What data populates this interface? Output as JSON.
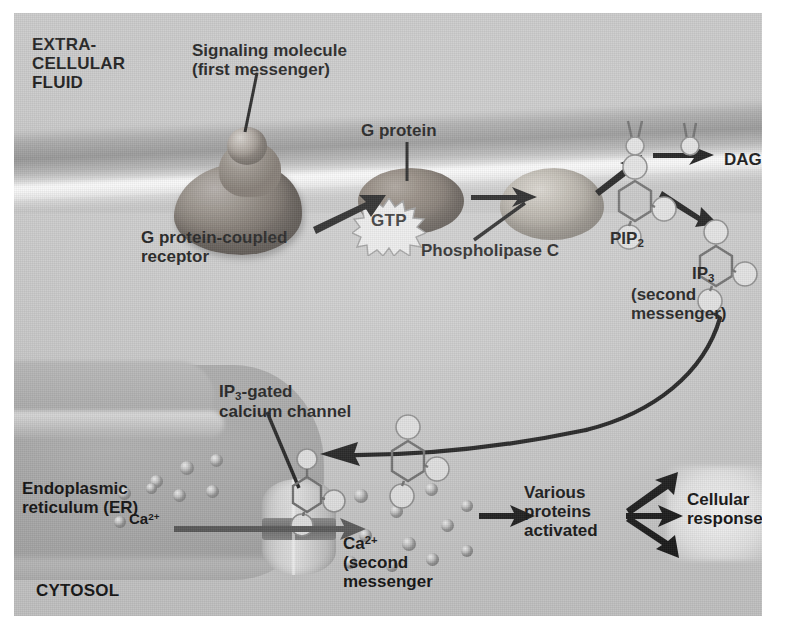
{
  "figure": {
    "accent_color": "#1b1b1b",
    "plate_bg": "#c9c9c9"
  },
  "regions": {
    "extracellular_label_line1": "EXTRA-",
    "extracellular_label_line2": "CELLULAR",
    "extracellular_label_line3": "FLUID",
    "cytosol_label": "CYTOSOL"
  },
  "labels": {
    "signaling_molecule_line1": "Signaling molecule",
    "signaling_molecule_line2": "(first messenger)",
    "gpcr_line1": "G protein-coupled",
    "gpcr_line2": "receptor",
    "g_protein": "G protein",
    "gtp": "GTP",
    "phospholipase_c": "Phospholipase C",
    "pip2": "PIP",
    "pip2_sub": "2",
    "dag": "DAG",
    "ip3": "IP",
    "ip3_sub": "3",
    "ip3_second_messenger": "(second messenger)",
    "ip3_gated_line1_a": "IP",
    "ip3_gated_line1_sub": "3",
    "ip3_gated_line1_b": "-gated",
    "ip3_gated_line2": "calcium channel",
    "er_line1": "Endoplasmic",
    "er_line2": "reticulum (ER)",
    "ca_er": "Ca",
    "ca_er_sup": "2+",
    "ca_cytosol": "Ca",
    "ca_cytosol_sup": "2+",
    "ca_cytosol_line2": "(second",
    "ca_cytosol_line3": "messenger",
    "various_line1": "Various",
    "various_line2": "proteins",
    "various_line3": "activated",
    "cellular_line1": "Cellular",
    "cellular_line2": "responses"
  },
  "icons": {
    "gtp_burst": "starburst-icon",
    "arrow": "arrow-right-icon",
    "curved_arrow": "curved-arrow-icon",
    "calcium_ion": "calcium-ion-icon",
    "pip2_molecule": "pip2-molecule-icon",
    "ip3_molecule": "ip3-molecule-icon",
    "dag_molecule": "dag-molecule-icon"
  }
}
